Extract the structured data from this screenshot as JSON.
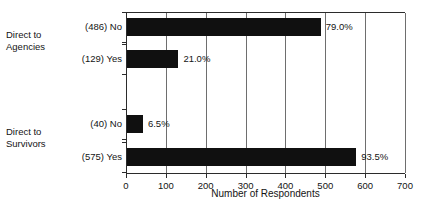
{
  "chart_data": {
    "type": "bar",
    "orientation": "horizontal",
    "title": "",
    "xlabel": "Number of Respondents",
    "ylabel": "",
    "xlim": [
      0,
      700
    ],
    "xticks": [
      0,
      100,
      200,
      300,
      400,
      500,
      600,
      700
    ],
    "grid": true,
    "legend": false,
    "bar_color": "#101010",
    "groups": [
      {
        "name": "Direct to\nAgencies",
        "bars": [
          {
            "category": "No",
            "count": 486,
            "label": "(486) No",
            "value_label": "79.0%",
            "percent": 79.0
          },
          {
            "category": "Yes",
            "count": 129,
            "label": "(129) Yes",
            "value_label": "21.0%",
            "percent": 21.0
          }
        ]
      },
      {
        "name": "Direct to\nSurvivors",
        "bars": [
          {
            "category": "No",
            "count": 40,
            "label": "(40) No",
            "value_label": "6.5%",
            "percent": 6.5
          },
          {
            "category": "Yes",
            "count": 575,
            "label": "(575) Yes",
            "value_label": "93.5%",
            "percent": 93.5
          }
        ]
      }
    ],
    "categories": [
      "(486) No",
      "(129) Yes",
      "(40) No",
      "(575) Yes"
    ],
    "values": [
      486,
      129,
      40,
      575
    ],
    "data_labels": [
      "79.0%",
      "21.0%",
      "6.5%",
      "93.5%"
    ]
  }
}
